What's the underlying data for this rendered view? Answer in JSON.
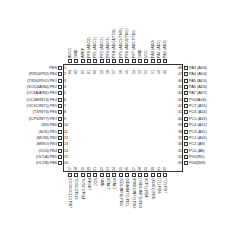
{
  "chip": {
    "package": "TQFP-64",
    "body_color": "#333333"
  },
  "pins": {
    "left": [
      {
        "num": "1",
        "label": "PEN"
      },
      {
        "num": "2",
        "label": "(RXD0/PDI) PE0"
      },
      {
        "num": "3",
        "label": "(TXD0/PDO) PE1"
      },
      {
        "num": "4",
        "label": "(XCK0/AIN0) PE2"
      },
      {
        "num": "5",
        "label": "(OC3A/AIN1) PE3"
      },
      {
        "num": "6",
        "label": "(OC3B/INT4) PE4"
      },
      {
        "num": "7",
        "label": "(OC3C/INT5) PE5"
      },
      {
        "num": "8",
        "label": "(T3/INT6) PE6"
      },
      {
        "num": "9",
        "label": "(ICP3/INT7) PE7"
      },
      {
        "num": "10",
        "label": "(SS) PB0"
      },
      {
        "num": "11",
        "label": "(SCK) PB1"
      },
      {
        "num": "12",
        "label": "(MOSI) PB2"
      },
      {
        "num": "13",
        "label": "(MISO) PB3"
      },
      {
        "num": "14",
        "label": "(OC0) PB4"
      },
      {
        "num": "15",
        "label": "(OC1A) PB5"
      },
      {
        "num": "16",
        "label": "(OC1B) PB6"
      }
    ],
    "bottom": [
      {
        "num": "17",
        "label": "(OC2/OC1C) PB7"
      },
      {
        "num": "18",
        "label": "TOSC2/PG3"
      },
      {
        "num": "19",
        "label": "TOSC1/PG4"
      },
      {
        "num": "20",
        "label": "RESET"
      },
      {
        "num": "21",
        "label": "VCC"
      },
      {
        "num": "22",
        "label": "GND"
      },
      {
        "num": "23",
        "label": "XTAL2"
      },
      {
        "num": "24",
        "label": "XTAL1"
      },
      {
        "num": "25",
        "label": "(SCL/INT0) PD0"
      },
      {
        "num": "26",
        "label": "(SDA/INT1) PD1"
      },
      {
        "num": "27",
        "label": "(RXD1/INT2) PD2"
      },
      {
        "num": "28",
        "label": "(TXD1/INT3) PD3"
      },
      {
        "num": "29",
        "label": "(ICP1) PD4"
      },
      {
        "num": "30",
        "label": "(XCK1) PD5"
      },
      {
        "num": "31",
        "label": "(T1) PD6"
      },
      {
        "num": "32",
        "label": "(T2) PD7"
      }
    ],
    "right": [
      {
        "num": "33",
        "label": "PG0(WR)"
      },
      {
        "num": "34",
        "label": "PG1(RD)"
      },
      {
        "num": "35",
        "label": "PC0 (A8)"
      },
      {
        "num": "36",
        "label": "PC1 (A9)"
      },
      {
        "num": "37",
        "label": "PC2 (A10)"
      },
      {
        "num": "38",
        "label": "PC3 (A11)"
      },
      {
        "num": "39",
        "label": "PC4 (A12)"
      },
      {
        "num": "40",
        "label": "PC5 (A13)"
      },
      {
        "num": "41",
        "label": "PC6 (A14)"
      },
      {
        "num": "42",
        "label": "PC7 (A15)"
      },
      {
        "num": "43",
        "label": "PG2(ALE)"
      },
      {
        "num": "44",
        "label": "PA7 (AD7)"
      },
      {
        "num": "45",
        "label": "PA6 (AD6)"
      },
      {
        "num": "46",
        "label": "PA5 (AD5)"
      },
      {
        "num": "47",
        "label": "PA4 (AD4)"
      },
      {
        "num": "48",
        "label": "PA3 (AD3)"
      }
    ],
    "top": [
      {
        "num": "49",
        "label": "PA2 (AD2)"
      },
      {
        "num": "50",
        "label": "PA1 (AD1)"
      },
      {
        "num": "51",
        "label": "PA0 (AD0)"
      },
      {
        "num": "52",
        "label": "VCC"
      },
      {
        "num": "53",
        "label": "GND"
      },
      {
        "num": "54",
        "label": "PF7 (ADC7/TDI)"
      },
      {
        "num": "55",
        "label": "PF6 (ADC6/TDO)"
      },
      {
        "num": "56",
        "label": "PF5 (ADC5/TMS)"
      },
      {
        "num": "57",
        "label": "PF4 (ADC4/TCK)"
      },
      {
        "num": "58",
        "label": "PF3 (ADC3)"
      },
      {
        "num": "59",
        "label": "PF2 (ADC2)"
      },
      {
        "num": "60",
        "label": "PF1 (ADC1)"
      },
      {
        "num": "61",
        "label": "PF0 (ADC0)"
      },
      {
        "num": "62",
        "label": "AREF"
      },
      {
        "num": "63",
        "label": "GND"
      },
      {
        "num": "64",
        "label": "AVCC"
      }
    ]
  }
}
